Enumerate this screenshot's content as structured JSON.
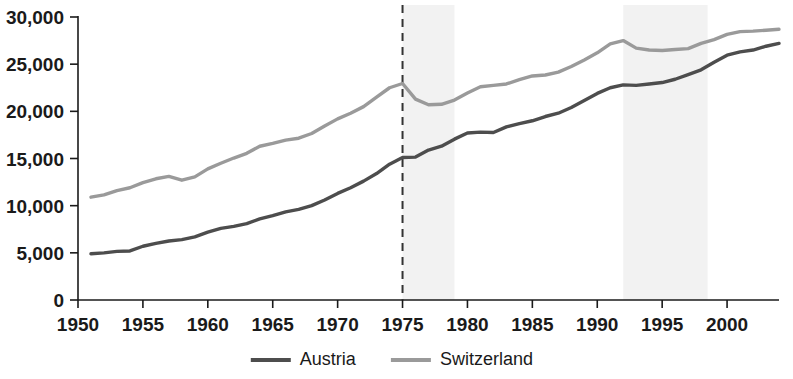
{
  "chart_data": {
    "type": "line",
    "title": "",
    "subtitle": "",
    "xlabel": "",
    "ylabel": "",
    "xlim": [
      1950,
      2004
    ],
    "ylim": [
      0,
      30000
    ],
    "grid": false,
    "legend_position": "bottom",
    "x_ticks": [
      1950,
      1955,
      1960,
      1965,
      1970,
      1975,
      1980,
      1985,
      1990,
      1995,
      2000
    ],
    "x_tick_labels": [
      "1950",
      "1955",
      "1960",
      "1965",
      "1970",
      "1975",
      "1980",
      "1985",
      "1990",
      "1995",
      "2000"
    ],
    "y_ticks": [
      0,
      5000,
      10000,
      15000,
      20000,
      25000,
      30000
    ],
    "y_tick_labels": [
      "0",
      "5,000",
      "10,000",
      "15,000",
      "20,000",
      "25,000",
      "30,000"
    ],
    "x": [
      1951,
      1952,
      1953,
      1954,
      1955,
      1956,
      1957,
      1958,
      1959,
      1960,
      1961,
      1962,
      1963,
      1964,
      1965,
      1966,
      1967,
      1968,
      1969,
      1970,
      1971,
      1972,
      1973,
      1974,
      1975,
      1976,
      1977,
      1978,
      1979,
      1980,
      1981,
      1982,
      1983,
      1984,
      1985,
      1986,
      1987,
      1988,
      1989,
      1990,
      1991,
      1992,
      1993,
      1994,
      1995,
      1996,
      1997,
      1998,
      1999,
      2000,
      2001,
      2002,
      2003,
      2004
    ],
    "series": [
      {
        "name": "Austria",
        "color": "#4d4d4d",
        "values": [
          4900,
          5000,
          5150,
          5200,
          5700,
          6000,
          6250,
          6400,
          6700,
          7200,
          7600,
          7800,
          8100,
          8600,
          8950,
          9350,
          9600,
          10000,
          10600,
          11300,
          11900,
          12600,
          13400,
          14400,
          15100,
          15150,
          15900,
          16300,
          17050,
          17700,
          17800,
          17750,
          18350,
          18700,
          19000,
          19450,
          19800,
          20400,
          21150,
          21900,
          22500,
          22800,
          22750,
          22900,
          23050,
          23400,
          23900,
          24400,
          25200,
          25950,
          26300,
          26500,
          26900,
          27200
        ]
      },
      {
        "name": "Switzerland",
        "color": "#9a9a9a",
        "values": [
          10900,
          11150,
          11600,
          11900,
          12450,
          12850,
          13100,
          12700,
          13050,
          13900,
          14500,
          15050,
          15550,
          16300,
          16600,
          16950,
          17150,
          17650,
          18450,
          19200,
          19800,
          20500,
          21500,
          22500,
          22950,
          21300,
          20700,
          20750,
          21200,
          21950,
          22600,
          22750,
          22900,
          23350,
          23750,
          23850,
          24150,
          24750,
          25450,
          26200,
          27150,
          27500,
          26700,
          26500,
          26450,
          26550,
          26650,
          27200,
          27600,
          28150,
          28450,
          28500,
          28600,
          28700
        ]
      }
    ],
    "annotations": [
      {
        "type": "vline",
        "name": "event-line-1975",
        "x": 1975,
        "style": "dashed",
        "color": "#333333"
      },
      {
        "type": "vband",
        "name": "recession-band-1",
        "x0": 1975,
        "x1": 1979,
        "color": "#f2f2f2"
      },
      {
        "type": "vband",
        "name": "recession-band-2",
        "x0": 1992,
        "x1": 1998.5,
        "color": "#f2f2f2"
      }
    ]
  },
  "legend": {
    "items": [
      {
        "label": "Austria",
        "color": "#4d4d4d",
        "width": 4
      },
      {
        "label": "Switzerland",
        "color": "#9a9a9a",
        "width": 4
      }
    ]
  }
}
